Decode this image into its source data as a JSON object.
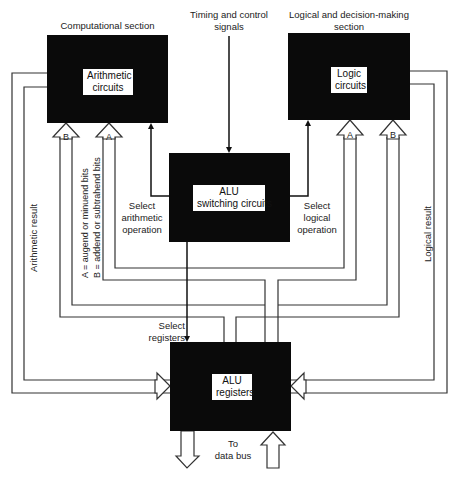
{
  "diagram": {
    "title_labels": {
      "computational": "Computational section",
      "timing_line1": "Timing and control",
      "timing_line2": "signals",
      "logical_line1": "Logical and decision-making",
      "logical_line2": "section"
    },
    "blocks": {
      "arithmetic": {
        "line1": "Arithmetic",
        "line2": "circuits"
      },
      "logic": {
        "line1": "Logic",
        "line2": "circuits"
      },
      "switching": {
        "line1": "ALU",
        "line2": "switching circuits"
      },
      "registers": {
        "line1": "ALU",
        "line2": "registers"
      }
    },
    "control_labels": {
      "select_arith_1": "Select",
      "select_arith_2": "arithmetic",
      "select_arith_3": "operation",
      "select_logic_1": "Select",
      "select_logic_2": "logical",
      "select_logic_3": "operation",
      "select_reg_1": "Select",
      "select_reg_2": "registers"
    },
    "input_labels": {
      "arith_b": "B",
      "arith_a": "A",
      "logic_a": "A",
      "logic_b": "B"
    },
    "side_labels": {
      "arithmetic_result": "Arithmetic result",
      "logical_result": "Logical result",
      "legend_a": "A = augend or minuend bits",
      "legend_b": "B = addend or subtrahend bits"
    },
    "bus_labels": {
      "to_line1": "To",
      "to_line2": "data bus"
    },
    "colors": {
      "block_fill": "#0a0a0a",
      "line": "#333333",
      "background": "#ffffff"
    }
  }
}
